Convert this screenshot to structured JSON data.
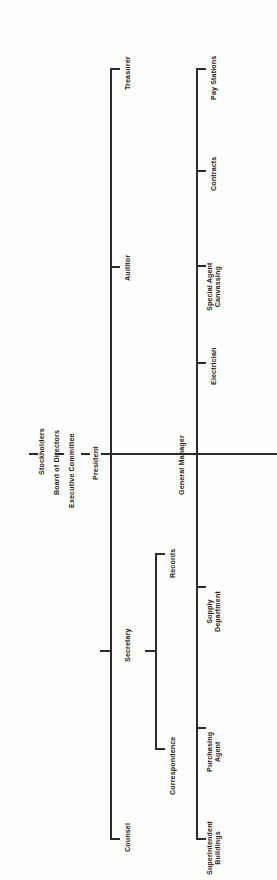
{
  "chart": {
    "type": "org-chart",
    "orientation": "rotated-90-ccw",
    "line_color": "#2b2b2b",
    "background_color": "#fdfdfc",
    "text_color": "#1d1d1d"
  },
  "top_chain": {
    "nodes": [
      {
        "id": "stockholders",
        "label": "Stockholders"
      },
      {
        "id": "board_of_directors",
        "label": "Board of Directors"
      },
      {
        "id": "executive_committee",
        "label": "Executive Committee"
      },
      {
        "id": "president",
        "label": "President"
      }
    ]
  },
  "spines": {
    "president": {
      "label": "President",
      "children": [
        {
          "id": "treasurer",
          "label": "Treasurer"
        },
        {
          "id": "auditor",
          "label": "Auditor"
        },
        {
          "id": "secretary",
          "label": "Secretary"
        },
        {
          "id": "counsel",
          "label": "Counsel"
        }
      ]
    },
    "secretary": {
      "label": "Secretary",
      "children": [
        {
          "id": "records",
          "label": "Records"
        },
        {
          "id": "correspondence",
          "label": "Correspondence"
        }
      ]
    },
    "general_manager": {
      "label": "General Manager",
      "children": [
        {
          "id": "pay_stations",
          "label": "Pay Stations"
        },
        {
          "id": "contracts",
          "label": "Contracts"
        },
        {
          "id": "special_agent_canvassing",
          "label": "Special Agent\nCanvassing"
        },
        {
          "id": "electrician",
          "label": "Electrician"
        },
        {
          "id": "supply_department",
          "label": "Supply\nDepartment"
        },
        {
          "id": "purchasing_agent",
          "label": "Purchasing\nAgent"
        },
        {
          "id": "superintendent_buildings",
          "label": "Superintendent\nBuildings"
        }
      ]
    }
  },
  "nodes": {
    "general_manager": {
      "label": "General Manager"
    }
  }
}
